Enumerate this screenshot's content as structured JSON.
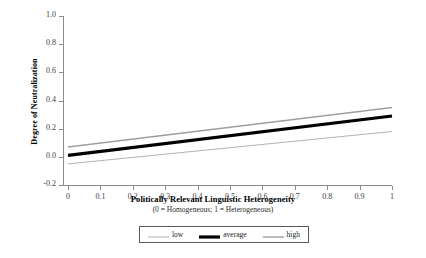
{
  "chart_data": {
    "type": "line",
    "title": "",
    "xlabel": "Politically Relevant Linguistic Heterogeneity",
    "xsublabel": "(0 = Homogeneous; 1 = Heterogeneous)",
    "ylabel": "Degree of Neutralization",
    "xlim": [
      0,
      1
    ],
    "ylim": [
      -0.2,
      1.0
    ],
    "grid": false,
    "legend_position": "below-axis-center",
    "xticks": [
      0,
      0.1,
      0.2,
      0.3,
      0.4,
      0.5,
      0.6,
      0.7,
      0.8,
      0.9,
      1
    ],
    "xtick_labels": [
      "0",
      "0.1",
      "0.2",
      "0.3",
      "0.4",
      "0.5",
      "0.6",
      "0.7",
      "0.8",
      "0.9",
      "1"
    ],
    "yticks": [
      -0.2,
      0.0,
      0.2,
      0.4,
      0.6,
      0.8,
      1.0
    ],
    "ytick_labels": [
      "-0.2",
      "0.0",
      "0.2",
      "0.4",
      "0.6",
      "0.8",
      "1.0"
    ],
    "x": [
      0,
      1
    ],
    "series": [
      {
        "name": "low",
        "values": [
          -0.05,
          0.18
        ],
        "color": "#b3b3b3",
        "width": 1
      },
      {
        "name": "average",
        "values": [
          0.01,
          0.29
        ],
        "color": "#000000",
        "width": 3.2
      },
      {
        "name": "high",
        "values": [
          0.07,
          0.35
        ],
        "color": "#9e9e9e",
        "width": 1.4
      }
    ]
  },
  "legend": {
    "entries": [
      {
        "label": "low"
      },
      {
        "label": "average"
      },
      {
        "label": "high"
      }
    ]
  },
  "colors": {
    "axis": "#8c8c8c",
    "tick_text": "#3d3d3d",
    "legend_border": "#5a5a5a",
    "background": "#ffffff"
  }
}
